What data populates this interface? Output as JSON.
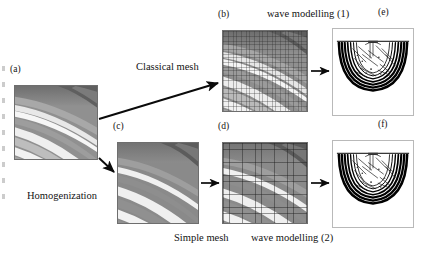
{
  "figure": {
    "kind": "workflow-diagram",
    "background_color": "#ffffff",
    "width": 426,
    "height": 255
  },
  "panels": {
    "a": {
      "letter": "(a)",
      "role": "original-fine-scale-model",
      "content_type": "grayscale-velocity-model",
      "mesh": "none",
      "x": 14,
      "y": 85,
      "w": 84,
      "h": 75
    },
    "b": {
      "letter": "(b)",
      "role": "classical-mesh-model",
      "content_type": "grayscale-velocity-model",
      "mesh": "fine",
      "x": 222,
      "y": 30,
      "w": 86,
      "h": 82
    },
    "c": {
      "letter": "(c)",
      "role": "homogenized-model",
      "content_type": "grayscale-velocity-model",
      "mesh": "none",
      "x": 117,
      "y": 142,
      "w": 82,
      "h": 82
    },
    "d": {
      "letter": "(d)",
      "role": "simple-mesh-model",
      "content_type": "grayscale-velocity-model",
      "mesh": "coarse",
      "x": 222,
      "y": 142,
      "w": 86,
      "h": 82
    },
    "e": {
      "letter": "(e)",
      "role": "wavefield-snapshot-classical",
      "content_type": "wavefield-snapshot",
      "mesh": "none",
      "x": 332,
      "y": 28,
      "w": 82,
      "h": 88
    },
    "f": {
      "letter": "(f)",
      "role": "wavefield-snapshot-homogenized",
      "content_type": "wavefield-snapshot",
      "mesh": "none",
      "x": 332,
      "y": 140,
      "w": 82,
      "h": 88
    }
  },
  "labels": {
    "classical_mesh": "Classical mesh",
    "homogenization": "Homogenization",
    "wave_modelling_1": "wave modelling (1)",
    "wave_modelling_2": "wave modelling (2)",
    "simple_mesh": "Simple mesh"
  },
  "arrows": [
    {
      "name": "a-to-b",
      "from_panel": "a",
      "to_panel": "b",
      "label": "Classical mesh",
      "direction": "up-right-diagonal"
    },
    {
      "name": "a-to-c",
      "from_panel": "a",
      "to_panel": "c",
      "label": "Homogenization",
      "direction": "down-right-diagonal"
    },
    {
      "name": "b-to-e",
      "from_panel": "b",
      "to_panel": "e",
      "label": "wave modelling (1)",
      "direction": "right"
    },
    {
      "name": "c-to-d",
      "from_panel": "c",
      "to_panel": "d",
      "label": "Simple mesh",
      "direction": "right"
    },
    {
      "name": "d-to-f",
      "from_panel": "d",
      "to_panel": "f",
      "label": "wave modelling (2)",
      "direction": "right"
    }
  ],
  "colors": {
    "ink": "#131313",
    "arrow": "#0a0a0a",
    "model_background": "#8c8c8c",
    "model_band_bright": "#f4f4f4",
    "model_band_dark": "#5e5e5e",
    "wave_background": "#ffffff",
    "wave_ink": "#000000",
    "panel_border": "#6e6e6e"
  }
}
